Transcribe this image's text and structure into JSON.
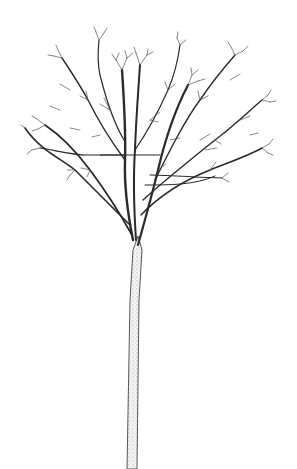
{
  "image": {
    "subject": "bare deciduous tree",
    "style": "pen-and-ink line drawing",
    "background_color": "#ffffff",
    "ink_color": "#2a2a2a",
    "trunk_stipple_color": "#9a9a9a"
  }
}
